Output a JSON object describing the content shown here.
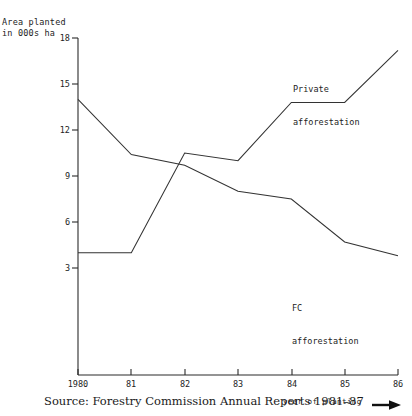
{
  "chart_data": {
    "type": "line",
    "title": "",
    "subtitle": "",
    "ylabel": "Area planted\nin 000s ha",
    "ylabel_lines": [
      "Area planted",
      "in 000s ha"
    ],
    "xlabel": "year of planting",
    "x": [
      1980,
      1981,
      1982,
      1983,
      1984,
      1985,
      1986
    ],
    "xtick_labels": [
      "1980",
      "81",
      "82",
      "83",
      "84",
      "85",
      "86"
    ],
    "ytick_labels": [
      "18",
      "15",
      "12",
      "9",
      "6",
      "3"
    ],
    "ytick_values": [
      18,
      15,
      12,
      9,
      6,
      3
    ],
    "ylim": [
      0.9,
      18
    ],
    "xlim": [
      1980,
      1986
    ],
    "grid": false,
    "legend_position": "inline-annotations",
    "series": [
      {
        "name": "FC afforestation",
        "label_lines": [
          "FC",
          "afforestation"
        ],
        "values": [
          14.0,
          10.4,
          9.7,
          8.0,
          7.5,
          4.7,
          3.8
        ],
        "color": "#333333"
      },
      {
        "name": "Private afforestation",
        "label_lines": [
          "Private",
          "afforestation"
        ],
        "values": [
          4.0,
          4.0,
          10.5,
          10.0,
          13.8,
          13.8,
          17.2
        ],
        "color": "#333333"
      }
    ],
    "annotations": [
      {
        "text": "Private afforestation",
        "series": "Private afforestation"
      },
      {
        "text": "FC afforestation",
        "series": "FC afforestation"
      }
    ]
  },
  "caption": {
    "source": "Source: Forestry Commission Annual Reports 1981–87",
    "x_axis_title": "year of planting",
    "arrow_icon": "arrow-right-icon"
  }
}
